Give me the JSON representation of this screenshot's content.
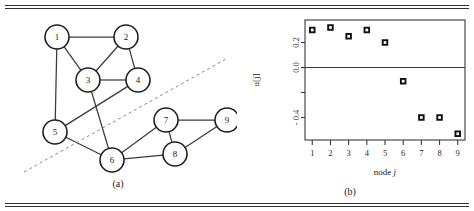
{
  "figure": {
    "panel_a": {
      "caption": "(a)",
      "graph": {
        "nodes": [
          {
            "id": "1",
            "x": 57,
            "y": 29,
            "r": 12
          },
          {
            "id": "2",
            "x": 126,
            "y": 29,
            "r": 12
          },
          {
            "id": "3",
            "x": 88,
            "y": 72,
            "r": 12
          },
          {
            "id": "4",
            "x": 138,
            "y": 72,
            "r": 12
          },
          {
            "id": "5",
            "x": 55,
            "y": 124,
            "r": 12
          },
          {
            "id": "6",
            "x": 112,
            "y": 152,
            "r": 12
          },
          {
            "id": "7",
            "x": 166,
            "y": 112,
            "r": 12
          },
          {
            "id": "8",
            "x": 175,
            "y": 146,
            "r": 12
          },
          {
            "id": "9",
            "x": 227,
            "y": 112,
            "r": 12
          }
        ],
        "edges": [
          [
            "1",
            "2"
          ],
          [
            "1",
            "3"
          ],
          [
            "1",
            "5"
          ],
          [
            "2",
            "3"
          ],
          [
            "2",
            "4"
          ],
          [
            "3",
            "4"
          ],
          [
            "3",
            "6"
          ],
          [
            "4",
            "5"
          ],
          [
            "5",
            "6"
          ],
          [
            "6",
            "7"
          ],
          [
            "6",
            "8"
          ],
          [
            "7",
            "8"
          ],
          [
            "7",
            "9"
          ],
          [
            "8",
            "9"
          ]
        ],
        "partition_line": {
          "x1": 24,
          "y1": 164,
          "x2": 226,
          "y2": 51,
          "style": "dashed"
        }
      }
    },
    "panel_b": {
      "caption": "(b)"
    }
  },
  "chart_data": {
    "type": "scatter",
    "title": "",
    "xlabel": "node j",
    "xlabel_plain": "node",
    "xlabel_italic": "j",
    "ylabel": "u[j]",
    "x": [
      1,
      2,
      3,
      4,
      5,
      6,
      7,
      8,
      9
    ],
    "values": [
      0.3,
      0.32,
      0.25,
      0.3,
      0.2,
      -0.11,
      -0.4,
      -0.4,
      -0.53
    ],
    "series": [
      {
        "name": "u[j]",
        "values": [
          0.3,
          0.32,
          0.25,
          0.3,
          0.2,
          -0.11,
          -0.4,
          -0.4,
          -0.53
        ]
      }
    ],
    "xticks": [
      "1",
      "2",
      "3",
      "4",
      "5",
      "6",
      "7",
      "8",
      "9"
    ],
    "xlim": [
      0.6,
      9.4
    ],
    "yticks": [
      0.2,
      0.0,
      -0.2,
      -0.4
    ],
    "yticklabels": [
      "0.2",
      "0.0",
      "",
      "- 0.4"
    ],
    "ylim": [
      -0.58,
      0.38
    ],
    "grid": false,
    "legend": false,
    "zero_line": 0.0,
    "marker": "open-square",
    "marker_color": "#1a1a1a"
  }
}
